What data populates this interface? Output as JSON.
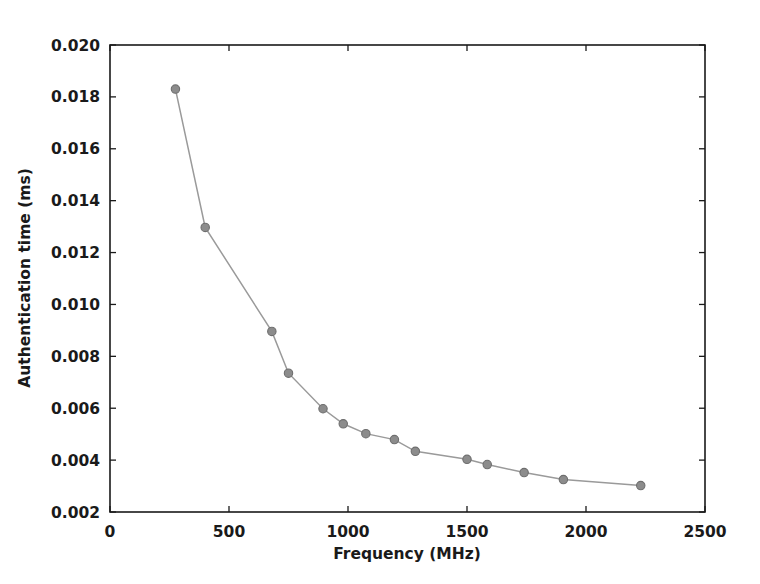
{
  "chart_data": {
    "type": "line",
    "title": "",
    "xlabel": "Frequency (MHz)",
    "ylabel": "Authentication time (ms)",
    "xlim": [
      0,
      2500
    ],
    "ylim": [
      0.002,
      0.02
    ],
    "grid": false,
    "legend": null,
    "xticks": [
      0,
      500,
      1000,
      1500,
      2000,
      2500
    ],
    "xtick_labels": [
      "0",
      "500",
      "1000",
      "1500",
      "2000",
      "2500"
    ],
    "yticks": [
      0.002,
      0.004,
      0.006,
      0.008,
      0.01,
      0.012,
      0.014,
      0.016,
      0.018,
      0.02
    ],
    "ytick_labels": [
      "0.002",
      "0.004",
      "0.006",
      "0.008",
      "0.010",
      "0.012",
      "0.014",
      "0.016",
      "0.018",
      "0.020"
    ],
    "series": [
      {
        "name": "Authentication time",
        "marker": "circle",
        "color": "#8c8c8c",
        "line_color": "#9a9a9a",
        "x": [
          275,
          400,
          680,
          750,
          895,
          980,
          1075,
          1195,
          1283,
          1500,
          1585,
          1740,
          1905,
          2230
        ],
        "y": [
          0.0183,
          0.01297,
          0.00896,
          0.00735,
          0.00598,
          0.0054,
          0.00502,
          0.00479,
          0.00434,
          0.00403,
          0.00383,
          0.00352,
          0.00325,
          0.00302
        ]
      }
    ]
  },
  "axes": {
    "x_axis_name": "frequency-axis",
    "y_axis_name": "authentication-time-axis"
  }
}
